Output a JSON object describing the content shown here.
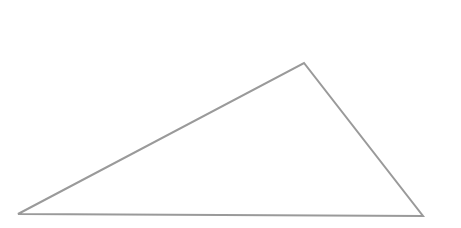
{
  "diagram": {
    "shape": "triangle",
    "background": "#ffffff",
    "stroke_color": "#9a9a9a",
    "stroke_width": 2,
    "fill": "none",
    "vertices": [
      {
        "name": "bottom-left",
        "x": 18,
        "y": 214
      },
      {
        "name": "apex",
        "x": 304,
        "y": 63
      },
      {
        "name": "bottom-right",
        "x": 423,
        "y": 216
      }
    ]
  }
}
